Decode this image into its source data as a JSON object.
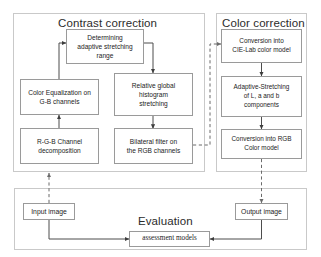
{
  "diagram": {
    "sections": [
      {
        "id": "contrast",
        "label": "Contrast correction"
      },
      {
        "id": "color",
        "label": "Color correction"
      },
      {
        "id": "evaluation",
        "label": "Evaluation"
      }
    ],
    "nodes": {
      "determining": "Determining adaptive stretching range",
      "determining_lines": [
        "Determining",
        "adaptive stretching",
        "range"
      ],
      "color_equalization": "Color Equalization on G-B channels",
      "color_equalization_lines": [
        "Color Equalization on",
        "G-B channels"
      ],
      "rgb_decomposition": "R-G-B Channel decomposition",
      "rgb_decomposition_lines": [
        "R-G-B Channel",
        "decomposition"
      ],
      "relative_histogram": "Relative global histogram stretching",
      "relative_histogram_lines": [
        "Relative global",
        "histogram",
        "stretching"
      ],
      "bilateral_filter": "Bilateral filter on the RGB channels",
      "bilateral_filter_lines": [
        "Bilateral filter on",
        "the RGB channels"
      ],
      "cielab_conversion": "Conversion into CIE-Lab color model",
      "cielab_conversion_lines": [
        "Conversion into",
        "CIE-Lab color model"
      ],
      "adaptive_stretching": "Adaptive-Stretching of L, a and b components",
      "adaptive_stretching_lines": [
        "Adaptive-Stretching",
        "of L, a and b",
        "components"
      ],
      "rgb_conversion": "Conversion into RGB Color model",
      "rgb_conversion_lines": [
        "Conversion into RGB",
        "Color model"
      ],
      "input_image": "Input image",
      "output_image": "Output image",
      "assessment_models": "assessment models"
    },
    "colors": {
      "node_border": "#9a9a9a",
      "section_border": "#c9c9c9",
      "connector": "#4d4d4d",
      "text": "#1c1c1c",
      "background": "#ffffff"
    },
    "connectors": [
      {
        "from": "input_image",
        "to": "rgb_decomposition",
        "style": "dashed"
      },
      {
        "from": "rgb_decomposition",
        "to": "color_equalization",
        "style": "solid"
      },
      {
        "from": "color_equalization",
        "to": "determining",
        "style": "solid"
      },
      {
        "from": "determining",
        "to": "relative_histogram",
        "style": "solid"
      },
      {
        "from": "relative_histogram",
        "to": "bilateral_filter",
        "style": "solid"
      },
      {
        "from": "bilateral_filter",
        "to": "cielab_conversion",
        "style": "dashed"
      },
      {
        "from": "cielab_conversion",
        "to": "adaptive_stretching",
        "style": "solid"
      },
      {
        "from": "adaptive_stretching",
        "to": "rgb_conversion",
        "style": "solid"
      },
      {
        "from": "rgb_conversion",
        "to": "output_image",
        "style": "dashed"
      },
      {
        "from": "input_image",
        "to": "assessment_models",
        "style": "solid"
      },
      {
        "from": "output_image",
        "to": "assessment_models",
        "style": "solid"
      }
    ]
  }
}
